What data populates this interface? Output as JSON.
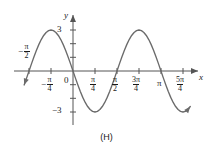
{
  "figure": {
    "caption": "(H)",
    "axis_labels": {
      "x": "x",
      "y": "y"
    }
  },
  "x_ticks": [
    {
      "id": "neg-pi-2",
      "sign": "−",
      "num": "π",
      "den": "2",
      "px": 29,
      "value": -1.5707963,
      "position": "above"
    },
    {
      "id": "neg-pi-4",
      "sign": "−",
      "num": "π",
      "den": "4",
      "px": 51,
      "value": -0.7853982,
      "position": "below"
    },
    {
      "id": "zero",
      "sign": "",
      "num": "0",
      "den": "",
      "px": 73,
      "value": 0,
      "position": "below"
    },
    {
      "id": "pi-4",
      "sign": "",
      "num": "π",
      "den": "4",
      "px": 95,
      "value": 0.7853982,
      "position": "below"
    },
    {
      "id": "pi-2",
      "sign": "",
      "num": "π",
      "den": "2",
      "px": 117,
      "value": 1.5707963,
      "position": "below"
    },
    {
      "id": "3pi-4",
      "sign": "",
      "num": "3π",
      "den": "4",
      "px": 139,
      "value": 2.3561945,
      "position": "below"
    },
    {
      "id": "pi",
      "sign": "",
      "num": "π",
      "den": "",
      "px": 161,
      "value": 3.1415927,
      "position": "below"
    },
    {
      "id": "5pi-4",
      "sign": "",
      "num": "5π",
      "den": "4",
      "px": 183,
      "value": 3.9269908,
      "position": "below"
    }
  ],
  "y_ticks": [
    {
      "id": "y-pos-3",
      "label": "3",
      "value": 3,
      "px": 30
    },
    {
      "id": "y-neg-3",
      "label": "−3",
      "value": -3,
      "px": 112
    }
  ],
  "chart_data": {
    "type": "line",
    "title": "",
    "subtitle": "",
    "xlabel": "x",
    "ylabel": "y",
    "grid": false,
    "legend": null,
    "annotations": [
      "(H)"
    ],
    "function": "y = -3 sin(2x)",
    "amplitude": 3,
    "period": 3.1415927,
    "xlim": [
      -1.7453293,
      4.1887902
    ],
    "ylim": [
      -3.6,
      3.6
    ],
    "xtick_labels": [
      "-π/2",
      "-π/4",
      "0",
      "π/4",
      "π/2",
      "3π/4",
      "π",
      "5π/4"
    ],
    "xtick_values": [
      -1.5707963,
      -0.7853982,
      0,
      0.7853982,
      1.5707963,
      2.3561945,
      3.1415927,
      3.9269908
    ],
    "ytick_labels": [
      "3",
      "-3"
    ],
    "ytick_values": [
      3,
      -3
    ],
    "key_points": [
      {
        "x": -1.5707963,
        "y": 0,
        "kind": "zero"
      },
      {
        "x": -0.7853982,
        "y": 3,
        "kind": "maximum"
      },
      {
        "x": 0,
        "y": 0,
        "kind": "zero"
      },
      {
        "x": 0.7853982,
        "y": -3,
        "kind": "minimum"
      },
      {
        "x": 1.5707963,
        "y": 0,
        "kind": "zero"
      },
      {
        "x": 2.3561945,
        "y": 3,
        "kind": "maximum"
      },
      {
        "x": 3.1415927,
        "y": 0,
        "kind": "zero"
      },
      {
        "x": 3.9269908,
        "y": -3,
        "kind": "minimum"
      }
    ],
    "series": [
      {
        "name": "y = -3 sin(2x)",
        "color": "#6b6b6b",
        "x": [
          -1.7453293,
          -1.6580628,
          -1.5707963,
          -1.4835299,
          -1.3962634,
          -1.3089969,
          -1.2217305,
          -1.134464,
          -1.0471976,
          -0.9599311,
          -0.8726646,
          -0.7853982,
          -0.6981317,
          -0.6108652,
          -0.5235988,
          -0.4363323,
          -0.3490659,
          -0.2617994,
          -0.1745329,
          -0.0872665,
          0,
          0.0872665,
          0.1745329,
          0.2617994,
          0.3490659,
          0.4363323,
          0.5235988,
          0.6108652,
          0.6981317,
          0.7853982,
          0.8726646,
          0.9599311,
          1.0471976,
          1.134464,
          1.2217305,
          1.3089969,
          1.3962634,
          1.4835299,
          1.5707963,
          1.6580628,
          1.7453293,
          1.8325957,
          1.9198622,
          2.0071286,
          2.0943951,
          2.1816616,
          2.268928,
          2.3561945,
          2.443461,
          2.5307274,
          2.6179939,
          2.7052603,
          2.7925268,
          2.8797933,
          2.9670597,
          3.0543262,
          3.1415927,
          3.2288591,
          3.3161256,
          3.403392,
          3.4906585,
          3.577925,
          3.6651914,
          3.7524579,
          3.8397244,
          3.9269908,
          4.0142573,
          4.1015237,
          4.1887902
        ],
        "y": [
          -1.02,
          -0.52,
          0,
          0.52,
          1.02,
          1.5,
          1.93,
          2.3,
          2.6,
          2.82,
          2.95,
          3,
          2.95,
          2.82,
          2.6,
          2.3,
          1.93,
          1.5,
          1.02,
          0.52,
          0,
          -0.52,
          -1.02,
          -1.5,
          -1.93,
          -2.3,
          -2.6,
          -2.82,
          -2.95,
          -3,
          -2.95,
          -2.82,
          -2.6,
          -2.3,
          -1.93,
          -1.5,
          -1.02,
          -0.52,
          0,
          0.52,
          1.02,
          1.5,
          1.93,
          2.3,
          2.6,
          2.82,
          2.95,
          3,
          2.95,
          2.82,
          2.6,
          2.3,
          1.93,
          1.5,
          1.02,
          0.52,
          0,
          -0.52,
          -1.02,
          -1.5,
          -1.93,
          -2.3,
          -2.6,
          -2.82,
          -2.95,
          -3,
          -2.95,
          -2.82,
          -2.6
        ]
      }
    ]
  }
}
